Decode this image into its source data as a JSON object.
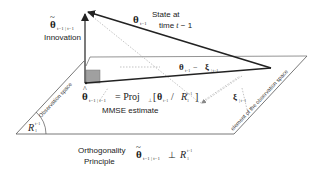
{
  "labels": {
    "state_line1": "State at",
    "state_line2": "time",
    "state_time_var": "t",
    "state_time_suffix": " − 1",
    "innovation": "Innovation",
    "mmse": "MMSE estimate",
    "observation_space": "Observation space",
    "element_of_observation_space": "element of the observation space",
    "orthogonality_line1": "Orthogonality",
    "orthogonality_line2": "Principle"
  },
  "math": {
    "theta_symbol": "θ",
    "xi_symbol": "ξ",
    "theta_sub": "t−1",
    "theta_tilde_sub": "t−1 | t−1",
    "theta_hat_sub": "t−1 | t−1",
    "xi_sub": "| t−1",
    "diff_minus": " − ",
    "proj_eq": " = Proj",
    "proj_sub": "⊥",
    "proj_bracket_open": "[",
    "proj_slash": " / ",
    "proj_bracket_close": "]",
    "R": "R",
    "R_sup": "t−1",
    "R_sub": "1",
    "perp": " ⊥ "
  },
  "colors": {
    "line": "#333333",
    "dotted": "#aaaaaa",
    "square": "#a0a0a0",
    "text": "#222222"
  }
}
